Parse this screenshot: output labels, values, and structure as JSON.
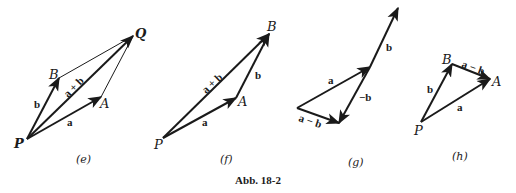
{
  "caption": "Abb. 18-2",
  "colors": {
    "ink": "#1a1a1a",
    "background": "#ffffff"
  },
  "panels": [
    {
      "id": "e",
      "label": "(e)",
      "points": {
        "P": "P",
        "A": "A",
        "B": "B",
        "Q": "Q"
      },
      "vectors": {
        "a": "a",
        "b": "b",
        "sum": "a + b"
      }
    },
    {
      "id": "f",
      "label": "(f)",
      "points": {
        "P": "P",
        "A": "A",
        "B": "B"
      },
      "vectors": {
        "a": "a",
        "b": "b",
        "sum": "a + b"
      }
    },
    {
      "id": "g",
      "label": "(g)",
      "vectors": {
        "a": "a",
        "b": "b",
        "neg_b": "−b",
        "diff": "a − b"
      }
    },
    {
      "id": "h",
      "label": "(h)",
      "points": {
        "P": "P",
        "A": "A",
        "B": "B"
      },
      "vectors": {
        "a": "a",
        "b": "b",
        "diff": "a − b"
      }
    }
  ]
}
